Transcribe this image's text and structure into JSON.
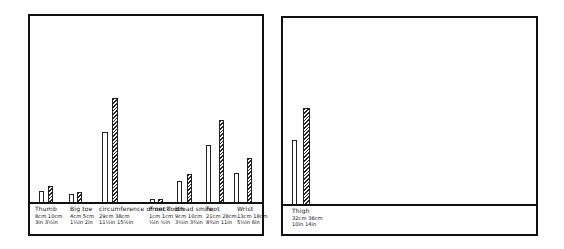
{
  "chart_data": [
    {
      "type": "bar",
      "title": "",
      "xlabel": "",
      "ylabel": "",
      "legend": [],
      "grid": false,
      "categories": [
        "Thumb",
        "Big toe",
        "Circumference of neck",
        "Front tooth",
        "Broad smile",
        "Foot",
        "Wrist"
      ],
      "category_labels": [
        {
          "name": "Thumb",
          "line1": "8cm  10cm",
          "line2": "3in  3½in"
        },
        {
          "name": "Big toe",
          "line1": "4cm  5cm",
          "line2": "1½in  2in"
        },
        {
          "name": "circumference of neck",
          "line1": "29cm  38cm",
          "line2": "11½in  15½in"
        },
        {
          "name": "Front Tooth",
          "line1": "1cm  1cm",
          "line2": "½in  ½in"
        },
        {
          "name": "Broad smile",
          "line1": "9cm  10cm",
          "line2": "3½in  3¾in"
        },
        {
          "name": "Foot",
          "line1": "21cm  28cm",
          "line2": "8¾in  11in"
        },
        {
          "name": "Wrist",
          "line1": "13cm  18cm",
          "line2": "5½in  6in"
        }
      ],
      "series": [
        {
          "name": "white",
          "style": "open",
          "values": [
            8,
            4,
            29,
            1,
            9,
            21,
            13
          ]
        },
        {
          "name": "hatched",
          "style": "hatched",
          "values": [
            10,
            5,
            38,
            1,
            10,
            28,
            18
          ]
        }
      ],
      "units": "cm",
      "ylim": [
        0,
        45
      ]
    },
    {
      "type": "bar",
      "title": "",
      "xlabel": "",
      "ylabel": "",
      "legend": [],
      "grid": false,
      "categories": [
        "Thigh"
      ],
      "category_labels": [
        {
          "name": "Thigh",
          "line1": "32cm  36cm",
          "line2": "10in  14in"
        }
      ],
      "series": [
        {
          "name": "white",
          "style": "open",
          "values": [
            32
          ]
        },
        {
          "name": "hatched",
          "style": "hatched",
          "values": [
            36
          ]
        }
      ],
      "units": "cm",
      "ylim": [
        0,
        45
      ]
    }
  ],
  "layout": {
    "left_panel": {
      "x": 28,
      "y": 14,
      "w": 236,
      "h": 222,
      "baseline_y": 188
    },
    "right_panel": {
      "x": 281,
      "y": 16,
      "w": 257,
      "h": 220,
      "baseline_y": 188
    }
  },
  "bars_px": {
    "left": [
      {
        "x": 9,
        "w": 5,
        "h": 13,
        "s": "open"
      },
      {
        "x": 18,
        "w": 5,
        "h": 18,
        "s": "hatched"
      },
      {
        "x": 39,
        "w": 5,
        "h": 10,
        "s": "open"
      },
      {
        "x": 47,
        "w": 5,
        "h": 12,
        "s": "hatched"
      },
      {
        "x": 72,
        "w": 6,
        "h": 72,
        "s": "open"
      },
      {
        "x": 82,
        "w": 6,
        "h": 106,
        "s": "hatched"
      },
      {
        "x": 120,
        "w": 5,
        "h": 5,
        "s": "open"
      },
      {
        "x": 128,
        "w": 5,
        "h": 5,
        "s": "hatched"
      },
      {
        "x": 147,
        "w": 5,
        "h": 23,
        "s": "open"
      },
      {
        "x": 157,
        "w": 5,
        "h": 30,
        "s": "hatched"
      },
      {
        "x": 176,
        "w": 5,
        "h": 59,
        "s": "open"
      },
      {
        "x": 189,
        "w": 5,
        "h": 84,
        "s": "hatched"
      },
      {
        "x": 204,
        "w": 5,
        "h": 31,
        "s": "open"
      },
      {
        "x": 217,
        "w": 5,
        "h": 46,
        "s": "hatched"
      }
    ],
    "right": [
      {
        "x": 9,
        "w": 5,
        "h": 66,
        "s": "open"
      },
      {
        "x": 20,
        "w": 7,
        "h": 98,
        "s": "hatched"
      }
    ]
  },
  "labels_px": {
    "left": [
      {
        "x": 5
      },
      {
        "x": 40
      },
      {
        "x": 69
      },
      {
        "x": 119
      },
      {
        "x": 145
      },
      {
        "x": 176
      },
      {
        "x": 207
      }
    ],
    "right": [
      {
        "x": 9
      }
    ]
  }
}
